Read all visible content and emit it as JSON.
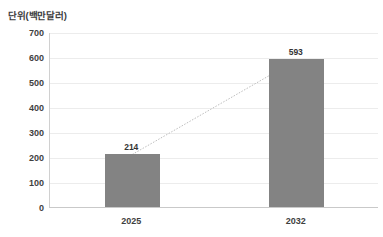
{
  "chart_data": {
    "type": "bar",
    "title": "단위(백만달러)",
    "xlabel": "",
    "ylabel": "단위(백만달러)",
    "categories": [
      "2025",
      "2032"
    ],
    "values": [
      214,
      593
    ],
    "series": [
      {
        "name": "시장 규모",
        "values": [
          214,
          593
        ]
      }
    ],
    "ylim": [
      0,
      700
    ],
    "ytick_step": 100,
    "yticks": [
      "700",
      "600",
      "500",
      "400",
      "300",
      "200",
      "100",
      "0"
    ],
    "ytick_values": [
      700,
      600,
      500,
      400,
      300,
      200,
      100,
      0
    ],
    "grid": true,
    "legend": "none",
    "annotations": [
      {
        "label": "214",
        "category": "2025",
        "value": 214
      },
      {
        "label": "593",
        "category": "2032",
        "value": 593
      }
    ],
    "connector": {
      "style": "dotted",
      "from": {
        "category": "2025",
        "value": 214
      },
      "to": {
        "category": "2032",
        "value": 593
      }
    },
    "colors": {
      "bar": "#838383",
      "gridline": "#ececec",
      "axis": "#c9c9c9",
      "text": "#3f3f3f",
      "connector": "#bdbdbd",
      "background": "#ffffff"
    }
  }
}
